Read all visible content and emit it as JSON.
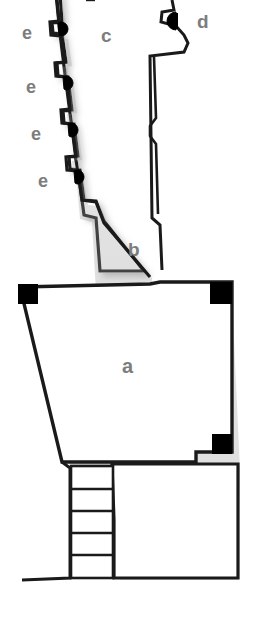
{
  "figure": {
    "kind": "architectural-floor-plan",
    "width": 258,
    "height": 643,
    "background_color": "#ffffff",
    "wall_stroke_color": "#1a1a1a",
    "wall_fill_color": "#ffffff",
    "shadow_color": "#d8d8d8",
    "marker_fill_color": "#000000",
    "label_color": "#7d7d7d"
  },
  "labels": {
    "room_a": "a",
    "room_b": "b",
    "room_c": "c",
    "feature_d": "d",
    "feature_e1": "e",
    "feature_e2": "e",
    "feature_e3": "e",
    "feature_e4": "e"
  },
  "features": {
    "black_corner_blocks": 3,
    "stair_steps": 5,
    "niche_markers_left": 4,
    "half_disc_markers": 5
  }
}
